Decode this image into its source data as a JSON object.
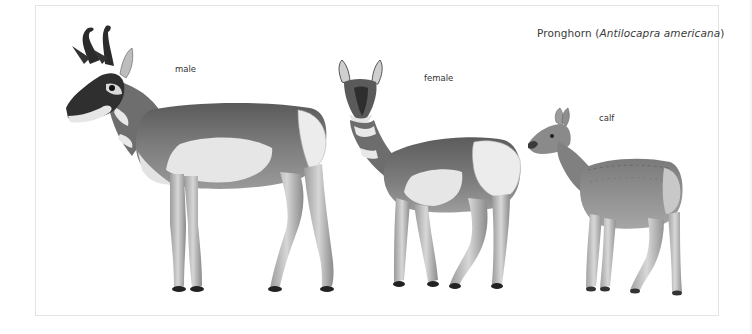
{
  "title": {
    "common_name": "Pronghorn",
    "open_paren": " (",
    "scientific_name": "Antilocapra americana",
    "close_paren": ")"
  },
  "figures": [
    {
      "label": "male"
    },
    {
      "label": "female"
    },
    {
      "label": "calf"
    }
  ],
  "colors": {
    "dark_fur": "#4a4a4a",
    "mid_fur": "#7a7a7a",
    "light_fur": "#e2e2e2",
    "horn": "#2a2a2a",
    "border": "#e4e4e4"
  }
}
